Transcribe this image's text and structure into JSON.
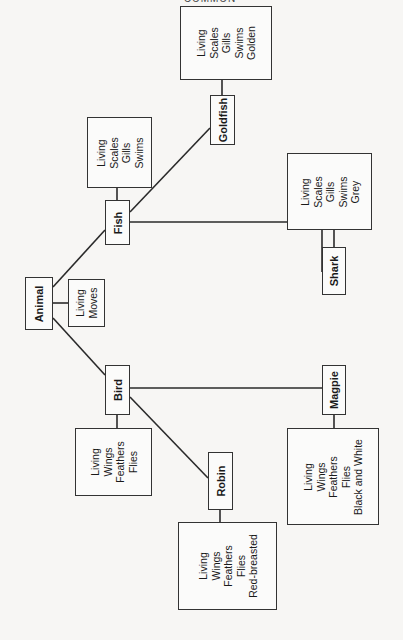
{
  "header": {
    "text": "COMMON"
  },
  "nodes": {
    "animal": {
      "label": "Animal",
      "attributes": [
        "Living",
        "Moves"
      ]
    },
    "fish": {
      "label": "Fish",
      "attributes": [
        "Living",
        "Scales",
        "Gills",
        "Swims"
      ]
    },
    "goldfish": {
      "label": "Goldfish",
      "attributes": [
        "Living",
        "Scales",
        "Gills",
        "Swims",
        "Golden"
      ]
    },
    "shark": {
      "label": "Shark",
      "attributes": [
        "Living",
        "Scales",
        "Gills",
        "Swims",
        "Grey"
      ]
    },
    "bird": {
      "label": "Bird",
      "attributes": [
        "Living",
        "Wings",
        "Feathers",
        "Flies"
      ]
    },
    "robin": {
      "label": "Robin",
      "attributes": [
        "Living",
        "Wings",
        "Feathers",
        "Flies",
        "Red-breasted"
      ]
    },
    "magpie": {
      "label": "Magpie",
      "attributes": [
        "Living",
        "Wings",
        "Feathers",
        "Flies",
        "Black and White"
      ]
    }
  },
  "edges": [
    [
      "animal",
      "fish"
    ],
    [
      "animal",
      "bird"
    ],
    [
      "fish",
      "goldfish"
    ],
    [
      "fish",
      "shark"
    ],
    [
      "bird",
      "robin"
    ],
    [
      "bird",
      "magpie"
    ]
  ],
  "colors": {
    "line": "#2a2a2a",
    "background": "#f7f6f4",
    "box": "#fbfbfa"
  }
}
